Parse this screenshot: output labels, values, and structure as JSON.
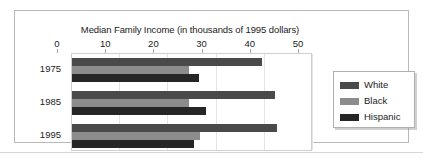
{
  "chart_data": {
    "type": "bar",
    "orientation": "horizontal",
    "title": "Median Family Income (in thousands of 1995 dollars)",
    "xlabel": "",
    "ylabel": "",
    "xlim": [
      0,
      50
    ],
    "xticks": [
      0,
      10,
      20,
      30,
      40,
      50
    ],
    "xtick_labels": [
      "0",
      "10",
      "20",
      "30",
      "40",
      "50"
    ],
    "categories": [
      "1975",
      "1985",
      "1995"
    ],
    "grid": true,
    "legend_position": "right",
    "series": [
      {
        "name": "White",
        "color": "#4a4a4a",
        "values": [
          39.4,
          42.1,
          42.5
        ]
      },
      {
        "name": "Black",
        "color": "#8c8c8c",
        "values": [
          24.2,
          24.2,
          26.5
        ]
      },
      {
        "name": "Hispanic",
        "color": "#262626",
        "values": [
          26.3,
          27.9,
          25.4
        ]
      }
    ]
  },
  "legend": {
    "items": [
      {
        "label": "White",
        "color": "#4a4a4a"
      },
      {
        "label": "Black",
        "color": "#8c8c8c"
      },
      {
        "label": "Hispanic",
        "color": "#262626"
      }
    ]
  },
  "colors": {
    "figure_border": "#b9b9b9",
    "plot_border": "#cfcfcf",
    "grid": "#e4e4e4",
    "text": "#1c1c1c",
    "background": "#ffffff"
  }
}
